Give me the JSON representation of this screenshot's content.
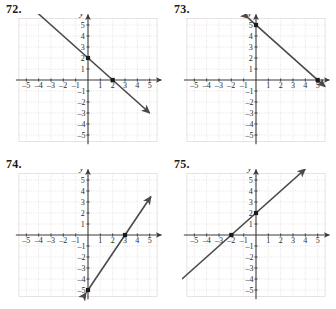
{
  "page": {
    "background": "#ffffff",
    "grid_color": "#d9cfcf",
    "axis_color": "#3a3a3a",
    "line_color": "#4a4a4a",
    "point_color": "#1a1a1a",
    "text_color": "#1a1a1a"
  },
  "axis_labels": {
    "x": "x",
    "y": "y"
  },
  "tick_labels": {
    "x_negative": [
      "-5",
      "-4",
      "-3",
      "-2",
      "-1"
    ],
    "x_positive": [
      "1",
      "2",
      "3",
      "4",
      "5"
    ],
    "y_positive": [
      "1",
      "2",
      "3",
      "4",
      "5"
    ],
    "y_negative": [
      "-1",
      "-2",
      "-3",
      "-4",
      "-5"
    ]
  },
  "problems": [
    {
      "number": "72.",
      "chart_data": {
        "type": "line",
        "title": "",
        "xlabel": "x",
        "ylabel": "y",
        "xlim": [
          -6,
          6
        ],
        "ylim": [
          -6,
          6
        ],
        "grid": true,
        "grid_style": "dotted",
        "legend": "none",
        "x": [
          -4,
          5
        ],
        "y": [
          6,
          -3
        ],
        "slope": -1,
        "y_intercept": 2,
        "equation": "y = -x + 2",
        "marked_points": [
          [
            0,
            2
          ],
          [
            2,
            0
          ]
        ],
        "arrows": [
          "start",
          "end"
        ]
      }
    },
    {
      "number": "73.",
      "chart_data": {
        "type": "line",
        "title": "",
        "xlabel": "x",
        "ylabel": "y",
        "xlim": [
          -6,
          6
        ],
        "ylim": [
          -6,
          6
        ],
        "grid": true,
        "grid_style": "dotted",
        "legend": "none",
        "x": [
          -0.6,
          5.6
        ],
        "y": [
          5.6,
          -0.6
        ],
        "slope": -1,
        "y_intercept": 5,
        "equation": "y = -x + 5",
        "marked_points": [
          [
            0,
            5
          ],
          [
            5,
            0
          ]
        ],
        "arrows": [
          "start",
          "end"
        ]
      }
    },
    {
      "number": "74.",
      "chart_data": {
        "type": "line",
        "title": "",
        "xlabel": "x",
        "ylabel": "y",
        "xlim": [
          -6,
          6
        ],
        "ylim": [
          -6,
          6
        ],
        "grid": true,
        "grid_style": "dotted",
        "legend": "none",
        "x": [
          -0.15,
          5.1
        ],
        "y": [
          -5.25,
          3.5
        ],
        "slope": 1.6666666667,
        "y_intercept": -5,
        "equation": "y = (5/3)x - 5",
        "marked_points": [
          [
            0,
            -5
          ],
          [
            3,
            0
          ]
        ],
        "arrows": [
          "start",
          "end"
        ]
      }
    },
    {
      "number": "75.",
      "chart_data": {
        "type": "line",
        "title": "",
        "xlabel": "x",
        "ylabel": "y",
        "xlim": [
          -6,
          6
        ],
        "ylim": [
          -6,
          6
        ],
        "grid": true,
        "grid_style": "dotted",
        "legend": "none",
        "x": [
          -6,
          4
        ],
        "y": [
          -4,
          6
        ],
        "slope": 1,
        "y_intercept": 2,
        "equation": "y = x + 2",
        "marked_points": [
          [
            -2,
            0
          ],
          [
            0,
            2
          ]
        ],
        "arrows": [
          "start",
          "end"
        ]
      }
    }
  ]
}
